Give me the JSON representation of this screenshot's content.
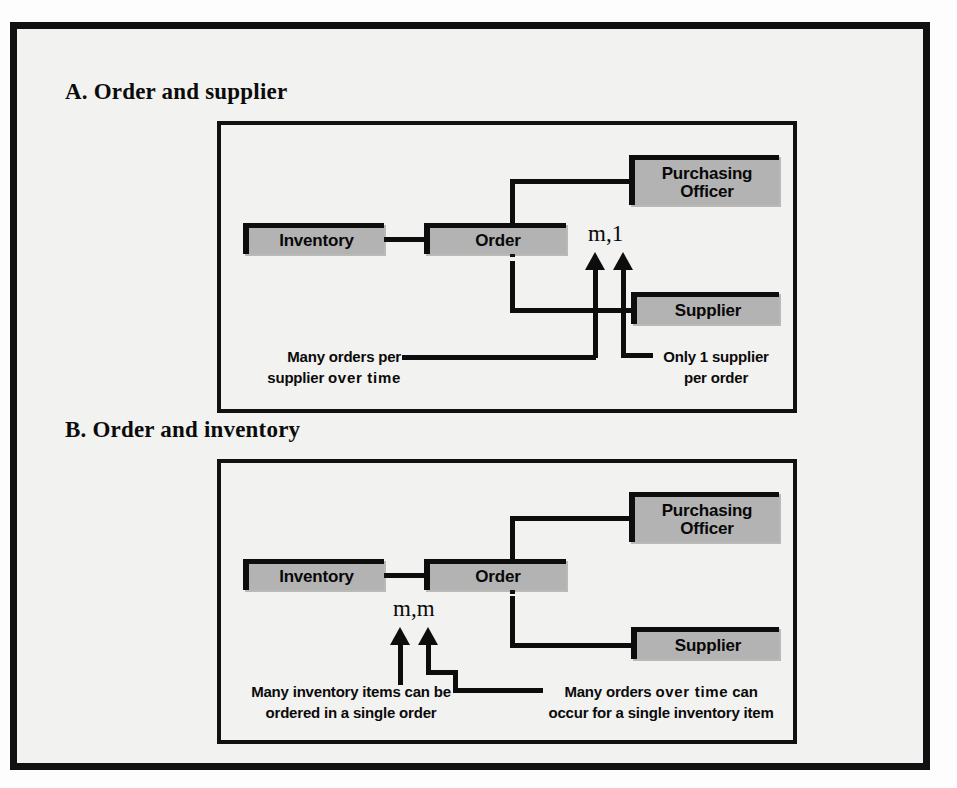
{
  "figure": {
    "panels": [
      {
        "id": "a",
        "caption": "A. Order and supplier",
        "entities": {
          "inventory": "Inventory",
          "order": "Order",
          "purchasing_officer_line1": "Purchasing",
          "purchasing_officer_line2": "Officer",
          "supplier": "Supplier"
        },
        "cardinality": "m,1",
        "annotations": {
          "left_line1": "Many orders per",
          "left_line2_plain": "supplier ",
          "left_line2_wide": "over time",
          "right_line1": "Only 1 supplier",
          "right_line2": "per order"
        }
      },
      {
        "id": "b",
        "caption": "B. Order and inventory",
        "entities": {
          "inventory": "Inventory",
          "order": "Order",
          "purchasing_officer_line1": "Purchasing",
          "purchasing_officer_line2": "Officer",
          "supplier": "Supplier"
        },
        "cardinality": "m,m",
        "annotations": {
          "left_line1": "Many inventory items can be",
          "left_line2": "ordered in a single order",
          "right_line1_pre": "Many orders ",
          "right_line1_wide": "over time",
          "right_line1_post": " can",
          "right_line2": "occur for a single inventory item"
        }
      }
    ],
    "colors": {
      "entity_fill": "#b3b3b3",
      "ink": "#0d0d0d",
      "page_background": "#f2f2f0"
    }
  }
}
